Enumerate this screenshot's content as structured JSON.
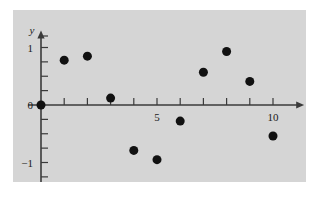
{
  "figure": {
    "background_color": "#ffffff",
    "panel_color": "#d5d5d5",
    "point_color": "#111111",
    "axis_color": "#3a3a3a"
  },
  "axes": {
    "x_axis_name": "x",
    "y_axis_name": "y",
    "x_tick_labels": [
      {
        "value": 5,
        "text": "5"
      },
      {
        "value": 10,
        "text": "10"
      }
    ],
    "y_tick_labels": [
      {
        "value": 1,
        "text": "1"
      },
      {
        "value": 0,
        "text": "0"
      },
      {
        "value": -1,
        "text": "−1"
      }
    ]
  },
  "chart_data": {
    "type": "scatter",
    "title": "",
    "xlabel": "x",
    "ylabel": "y",
    "xlim": [
      -0.55,
      11.3
    ],
    "ylim": [
      -1.35,
      1.28
    ],
    "xticks": [
      0,
      1,
      2,
      3,
      4,
      5,
      6,
      7,
      8,
      9,
      10
    ],
    "yticks": [
      -1.25,
      -1,
      -0.75,
      -0.5,
      -0.25,
      0,
      0.25,
      0.5,
      0.75,
      1,
      1.2
    ],
    "xtick_labels_shown": [
      "5",
      "10"
    ],
    "ytick_labels_shown": [
      "1",
      "0",
      "−1"
    ],
    "grid": false,
    "legend": false,
    "marker": "filled-circle",
    "marker_size_px": 9,
    "x": [
      0,
      1,
      2,
      3,
      4,
      5,
      6,
      7,
      8,
      9,
      10
    ],
    "y": [
      0,
      0.78,
      0.85,
      0.12,
      -0.79,
      -0.95,
      -0.28,
      0.57,
      0.93,
      0.41,
      -0.54
    ],
    "points": [
      {
        "x": 0,
        "y": 0
      },
      {
        "x": 1,
        "y": 0.78
      },
      {
        "x": 2,
        "y": 0.85
      },
      {
        "x": 3,
        "y": 0.12
      },
      {
        "x": 4,
        "y": -0.79
      },
      {
        "x": 5,
        "y": -0.95
      },
      {
        "x": 6,
        "y": -0.28
      },
      {
        "x": 7,
        "y": 0.57
      },
      {
        "x": 8,
        "y": 0.93
      },
      {
        "x": 9,
        "y": 0.41
      },
      {
        "x": 10,
        "y": -0.54
      }
    ]
  }
}
